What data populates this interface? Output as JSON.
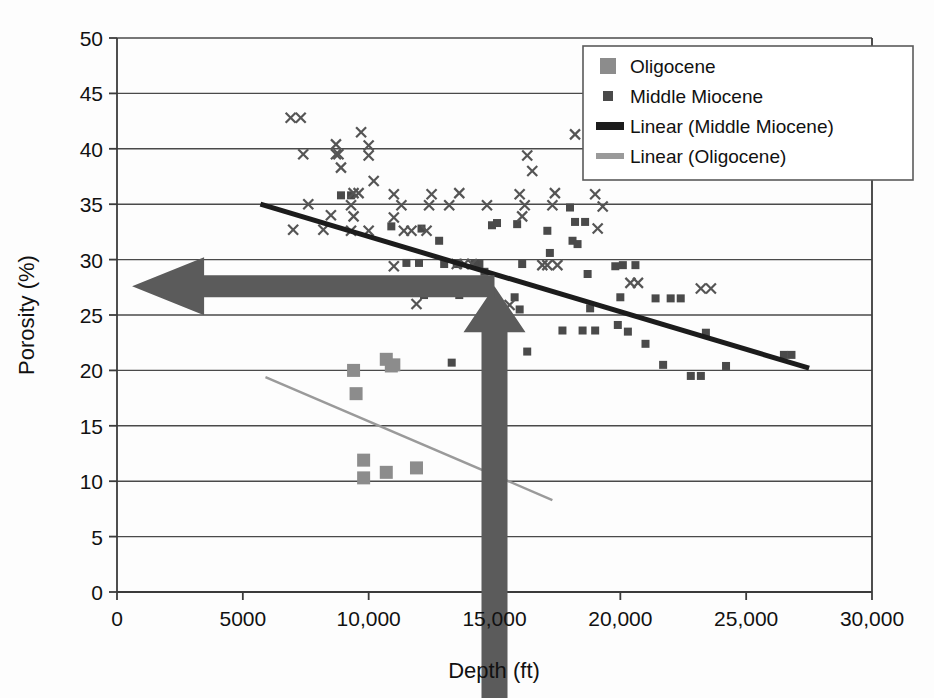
{
  "chart_data": {
    "type": "scatter",
    "title": "",
    "xlabel": "Depth (ft)",
    "ylabel": "Porosity (%)",
    "xlim": [
      0,
      30000
    ],
    "ylim": [
      0,
      50
    ],
    "xticks": [
      0,
      5000,
      10000,
      15000,
      20000,
      25000,
      30000
    ],
    "xtick_labels": [
      "0",
      "5000",
      "10,000",
      "15,000",
      "20,000",
      "25,000",
      "30,000"
    ],
    "yticks": [
      0,
      5,
      10,
      15,
      20,
      25,
      30,
      35,
      40,
      45,
      50
    ],
    "ytick_labels": [
      "0",
      "5",
      "10",
      "15",
      "20",
      "25",
      "30",
      "35",
      "40",
      "45",
      "50"
    ],
    "grid": "horizontal",
    "legend_position": "top-right",
    "series": [
      {
        "name": "Oligocene",
        "marker": "square",
        "marker_size": 13,
        "color": "#8c8c8c",
        "points": [
          [
            9400,
            20.0
          ],
          [
            9500,
            17.9
          ],
          [
            10700,
            21.0
          ],
          [
            10900,
            20.4
          ],
          [
            11000,
            20.5
          ],
          [
            9800,
            11.9
          ],
          [
            9800,
            10.3
          ],
          [
            10700,
            10.8
          ],
          [
            11900,
            11.2
          ]
        ]
      },
      {
        "name": "Middle Miocene",
        "marker": "small-square",
        "marker_size": 8,
        "color": "#4a4a4a",
        "points": [
          [
            8900,
            35.8
          ],
          [
            9300,
            35.8
          ],
          [
            10900,
            33.0
          ],
          [
            12100,
            32.8
          ],
          [
            12800,
            31.7
          ],
          [
            13000,
            29.6
          ],
          [
            13500,
            29.6
          ],
          [
            12200,
            26.8
          ],
          [
            13600,
            26.8
          ],
          [
            13300,
            20.7
          ],
          [
            14400,
            29.6
          ],
          [
            14600,
            28.9
          ],
          [
            14900,
            33.1
          ],
          [
            15100,
            33.3
          ],
          [
            15900,
            33.2
          ],
          [
            16100,
            29.6
          ],
          [
            16000,
            25.5
          ],
          [
            16300,
            21.7
          ],
          [
            15800,
            26.6
          ],
          [
            17100,
            32.6
          ],
          [
            17200,
            30.6
          ],
          [
            18000,
            34.7
          ],
          [
            18200,
            33.4
          ],
          [
            18600,
            33.4
          ],
          [
            18100,
            31.7
          ],
          [
            18300,
            31.4
          ],
          [
            17700,
            23.6
          ],
          [
            18500,
            23.6
          ],
          [
            19000,
            23.6
          ],
          [
            18700,
            28.7
          ],
          [
            18800,
            25.6
          ],
          [
            19800,
            29.4
          ],
          [
            20100,
            29.5
          ],
          [
            20000,
            26.6
          ],
          [
            19900,
            24.1
          ],
          [
            20600,
            29.5
          ],
          [
            20300,
            23.5
          ],
          [
            21000,
            22.4
          ],
          [
            21700,
            20.5
          ],
          [
            22800,
            19.5
          ],
          [
            23200,
            19.5
          ],
          [
            23400,
            23.4
          ],
          [
            24200,
            20.4
          ],
          [
            26500,
            21.4
          ],
          [
            26800,
            21.4
          ],
          [
            11500,
            29.7
          ],
          [
            12000,
            29.7
          ],
          [
            14200,
            29.6
          ],
          [
            21400,
            26.5
          ],
          [
            22000,
            26.5
          ],
          [
            22400,
            26.5
          ]
        ]
      },
      {
        "name": "Middle Miocene (x)",
        "marker": "x",
        "marker_size": 10,
        "color": "#555555",
        "points": [
          [
            6900,
            42.8
          ],
          [
            7300,
            42.8
          ],
          [
            7400,
            39.5
          ],
          [
            8700,
            40.4
          ],
          [
            8700,
            39.5
          ],
          [
            8800,
            39.5
          ],
          [
            8900,
            38.3
          ],
          [
            9700,
            41.5
          ],
          [
            10000,
            40.3
          ],
          [
            10000,
            39.4
          ],
          [
            10200,
            37.1
          ],
          [
            7600,
            35.0
          ],
          [
            7000,
            32.7
          ],
          [
            8500,
            34.0
          ],
          [
            8200,
            32.7
          ],
          [
            9400,
            36.0
          ],
          [
            9600,
            36.0
          ],
          [
            9300,
            34.9
          ],
          [
            9400,
            33.9
          ],
          [
            9300,
            32.6
          ],
          [
            10000,
            32.6
          ],
          [
            11000,
            35.9
          ],
          [
            11300,
            34.9
          ],
          [
            11000,
            33.8
          ],
          [
            11400,
            32.6
          ],
          [
            11700,
            32.6
          ],
          [
            12500,
            35.9
          ],
          [
            12400,
            34.9
          ],
          [
            12300,
            32.6
          ],
          [
            11000,
            29.4
          ],
          [
            11900,
            26.0
          ],
          [
            13500,
            29.6
          ],
          [
            13800,
            29.6
          ],
          [
            14100,
            29.6
          ],
          [
            13200,
            34.9
          ],
          [
            13600,
            36.0
          ],
          [
            14700,
            34.9
          ],
          [
            16300,
            39.4
          ],
          [
            16500,
            38.0
          ],
          [
            16000,
            35.9
          ],
          [
            16200,
            34.9
          ],
          [
            16100,
            33.9
          ],
          [
            17400,
            36.0
          ],
          [
            17300,
            34.9
          ],
          [
            16900,
            29.5
          ],
          [
            17100,
            29.5
          ],
          [
            17500,
            29.5
          ],
          [
            18200,
            41.3
          ],
          [
            19000,
            35.9
          ],
          [
            19300,
            34.8
          ],
          [
            19100,
            32.8
          ],
          [
            20400,
            27.9
          ],
          [
            20700,
            27.9
          ],
          [
            23200,
            27.4
          ],
          [
            23600,
            27.4
          ],
          [
            15600,
            25.9
          ]
        ]
      }
    ],
    "trendlines": [
      {
        "name": "Linear (Middle Miocene)",
        "color": "#1c1c1c",
        "width": 5,
        "x0": 5700,
        "y0": 35.0,
        "x1": 27500,
        "y1": 20.2
      },
      {
        "name": "Linear (Oligocene)",
        "color": "#9a9a9a",
        "width": 2.4,
        "x0": 5900,
        "y0": 19.4,
        "x1": 17300,
        "y1": 8.3
      }
    ],
    "legend": [
      {
        "label": "Oligocene",
        "type": "square",
        "color": "#8c8c8c"
      },
      {
        "label": "Middle Miocene",
        "type": "small-square",
        "color": "#4a4a4a"
      },
      {
        "label": "Linear (Middle Miocene)",
        "type": "line-thick",
        "color": "#1c1c1c"
      },
      {
        "label": "Linear (Oligocene)",
        "type": "line-thin",
        "color": "#9a9a9a"
      }
    ],
    "annotations": [
      {
        "name": "vertical-arrow",
        "direction": "up",
        "color": "#5b5b5b",
        "x_value": 15000,
        "y_from": 0,
        "y_to": 27.6,
        "description": "Thick upward arrow at 15,000 ft"
      },
      {
        "name": "horizontal-arrow",
        "direction": "left",
        "color": "#5b5b5b",
        "y_value": 27.6,
        "x_from": 15000,
        "x_to": 600,
        "description": "Thick leftward arrow at 27.6% porosity"
      }
    ]
  },
  "colors": {
    "oligocene": "#8c8c8c",
    "middle_miocene": "#4a4a4a",
    "trend_miocene": "#1c1c1c",
    "trend_oligocene": "#9a9a9a",
    "annotation_arrow": "#5b5b5b",
    "grid": "#4a4a4a",
    "background": "#fdfdfd"
  }
}
